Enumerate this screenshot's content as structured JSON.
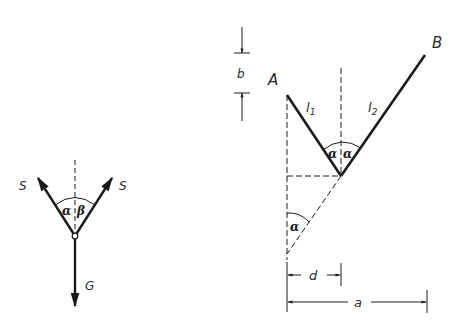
{
  "left_figure": {
    "force_left_label": "S",
    "force_right_label": "S",
    "weight_label": "G",
    "angle_left_label": "α",
    "angle_right_label": "β"
  },
  "right_figure": {
    "point_a_label": "A",
    "point_b_label": "B",
    "segment_1_label": "l",
    "segment_1_sub": "1",
    "segment_2_label": "l",
    "segment_2_sub": "2",
    "angle_left_label": "α",
    "angle_right_label": "α",
    "angle_lower_label": "α",
    "dim_b_label": "b",
    "dim_d_label": "d",
    "dim_a_label": "a"
  },
  "colors": {
    "line": "#1a1a1a",
    "background": "#ffffff"
  }
}
